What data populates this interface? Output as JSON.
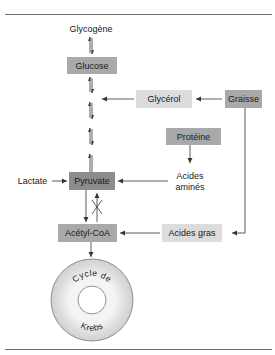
{
  "diagram": {
    "nodes": {
      "glycogene": "Glycogène",
      "glucose": "Glucose",
      "glycerol": "Glycérol",
      "graisse": "Graisse",
      "proteine": "Protéine",
      "acides_amines_line1": "Acides",
      "acides_amines_line2": "aminés",
      "lactate": "Lactate",
      "pyruvate": "Pyruvate",
      "acetyl_coa": "Acétyl-CoA",
      "acides_gras": "Acides gras",
      "krebs_top": "Cycle de",
      "krebs_bottom": "Krebs"
    },
    "edges": [
      {
        "from": "Glycogène",
        "to": "Glucose",
        "type": "reversible"
      },
      {
        "from": "Glucose",
        "to": "Pyruvate",
        "type": "reversible"
      },
      {
        "from": "Graisse",
        "to": "Glycérol",
        "type": "forward"
      },
      {
        "from": "Glycérol",
        "to": "Glucose-Pyruvate pathway",
        "type": "forward"
      },
      {
        "from": "Graisse",
        "to": "Acides gras",
        "type": "forward"
      },
      {
        "from": "Protéine",
        "to": "Acides aminés",
        "type": "forward"
      },
      {
        "from": "Acides aminés",
        "to": "Pyruvate",
        "type": "forward"
      },
      {
        "from": "Lactate",
        "to": "Pyruvate",
        "type": "forward"
      },
      {
        "from": "Pyruvate",
        "to": "Acétyl-CoA",
        "type": "forward"
      },
      {
        "from": "Acétyl-CoA",
        "to": "Pyruvate",
        "type": "blocked"
      },
      {
        "from": "Acides gras",
        "to": "Acétyl-CoA",
        "type": "forward"
      },
      {
        "from": "Acétyl-CoA",
        "to": "Cycle de Krebs",
        "type": "forward"
      }
    ],
    "colors": {
      "dark_box": "#8c8c8c",
      "medium_box": "#a9a9a9",
      "light_box": "#dcdcdc",
      "line": "#333333",
      "rule": "#6e6e6e"
    }
  }
}
